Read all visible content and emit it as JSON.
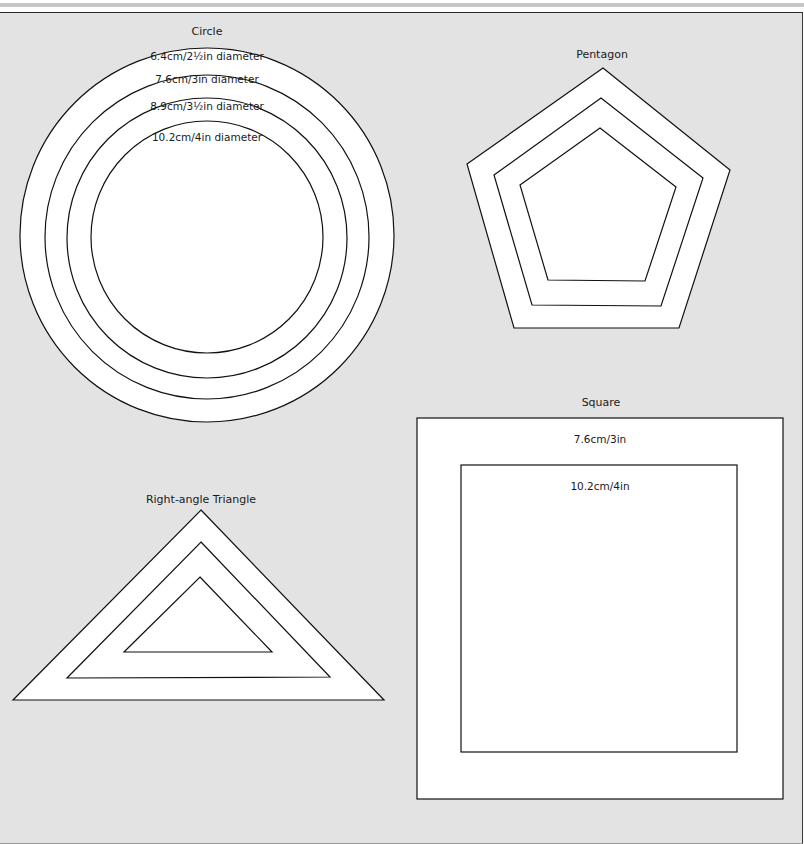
{
  "colors": {
    "background": "#e3e3e3",
    "shape_fill": "#ffffff",
    "stroke": "#111111"
  },
  "circle": {
    "title": "Circle",
    "rings": [
      {
        "label": "6.4cm/2½in diameter",
        "r": 187
      },
      {
        "label": "7.6cm/3in diameter",
        "r": 162
      },
      {
        "label": "8.9cm/3½in diameter",
        "r": 140
      },
      {
        "label": "10.2cm/4in diameter",
        "r": 116
      }
    ]
  },
  "pentagon": {
    "title": "Pentagon",
    "layers": [
      {
        "points": "603,68 730,170 679,328 514,328 467,164"
      },
      {
        "points": "601,98 703,178 661,306 532,305 494,175"
      },
      {
        "points": "600,128 676,187 645,281 548,280 520,185"
      }
    ]
  },
  "square": {
    "title": "Square",
    "layers": [
      {
        "label": "7.6cm/3in"
      },
      {
        "label": "10.2cm/4in"
      }
    ]
  },
  "triangle": {
    "title": "Right-angle Triangle",
    "layers": [
      {
        "points": "201,510 384,700 13,700"
      },
      {
        "points": "201,542 330,677 67,678"
      },
      {
        "points": "200,577 272,652 124,652"
      }
    ]
  }
}
